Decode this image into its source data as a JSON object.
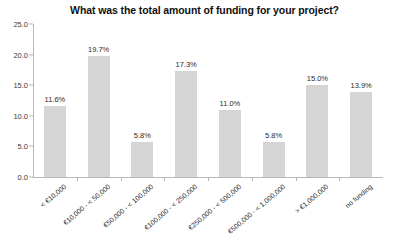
{
  "chart_data": {
    "type": "bar",
    "title": "What was the total amount of funding for your project?",
    "xlabel": "",
    "ylabel": "",
    "ylim": [
      0,
      25
    ],
    "ytick_step": 5,
    "ytick_labels": [
      "0.0",
      "5.0",
      "10.0",
      "15.0",
      "20.0",
      "25.0"
    ],
    "grid": false,
    "legend": "none",
    "categories": [
      "< €10,000",
      "€10,000 - < 50,000",
      "€50,000 - < 100,000",
      "€100,000 - < 250,000",
      "€250,000 - < 500,000",
      "€500,000 - < 1,000,000",
      "> €1,000,000",
      "no funding"
    ],
    "values": [
      11.6,
      19.7,
      5.8,
      17.3,
      11.0,
      5.8,
      15.0,
      13.9
    ],
    "value_labels": [
      "11.6%",
      "19.7%",
      "5.8%",
      "17.3%",
      "11.0%",
      "5.8%",
      "15.0%",
      "13.9%"
    ],
    "bar_color": "#d5d5d5",
    "axis_color": "#b8b8b8",
    "text_color": "#2b2b2b",
    "background": "#ffffff"
  }
}
